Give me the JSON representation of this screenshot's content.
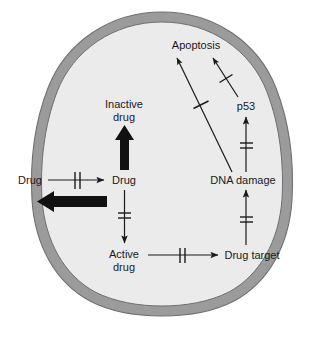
{
  "figure": {
    "background_color": "#ffffff"
  },
  "cell": {
    "name": "cell",
    "membrane_color": "#9b9b9b",
    "membrane_outline_color": "#6f6f6f",
    "cytoplasm_color": "#ebebeb",
    "shape": "ovoid"
  },
  "nodes": {
    "extracellular_drug": {
      "label": "Drug",
      "x": 30,
      "y": 182
    },
    "intracellular_drug": {
      "label": "Drug",
      "x": 124,
      "y": 182
    },
    "inactive_drug": {
      "label_line1": "Inactive",
      "label_line2": "drug",
      "x": 124,
      "y": 118
    },
    "active_drug": {
      "label_line1": "Active",
      "label_line2": "drug",
      "x": 124,
      "y": 255
    },
    "drug_target": {
      "label": "Drug target",
      "x": 252,
      "y": 256
    },
    "dna_damage": {
      "label": "DNA damage",
      "x": 243,
      "y": 181
    },
    "p53": {
      "label": "p53",
      "x": 246,
      "y": 107
    },
    "apoptosis": {
      "label": "Apoptosis",
      "x": 196,
      "y": 46
    }
  },
  "edges": [
    {
      "name": "drug-influx",
      "from": "extracellular_drug",
      "to": "intracellular_drug",
      "style": "thin-arrow",
      "marker": "double-bar"
    },
    {
      "name": "drug-efflux",
      "from": "intracellular_drug",
      "to": "extracellular_drug",
      "style": "thick-arrow",
      "marker": "none"
    },
    {
      "name": "drug-inactivation",
      "from": "intracellular_drug",
      "to": "inactive_drug",
      "style": "thick-arrow",
      "marker": "none"
    },
    {
      "name": "drug-activation",
      "from": "intracellular_drug",
      "to": "active_drug",
      "style": "thin-arrow",
      "marker": "double-bar"
    },
    {
      "name": "active-drug-to-target",
      "from": "active_drug",
      "to": "drug_target",
      "style": "thin-arrow",
      "marker": "double-bar"
    },
    {
      "name": "target-to-dna-damage",
      "from": "drug_target",
      "to": "dna_damage",
      "style": "thin-arrow",
      "marker": "double-bar"
    },
    {
      "name": "dna-damage-to-p53",
      "from": "dna_damage",
      "to": "p53",
      "style": "thin-arrow",
      "marker": "double-bar"
    },
    {
      "name": "p53-to-apoptosis",
      "from": "p53",
      "to": "apoptosis",
      "style": "thin-arrow",
      "marker": "single-bar"
    },
    {
      "name": "dna-damage-to-apoptosis",
      "from": "dna_damage",
      "to": "apoptosis",
      "style": "thin-arrow",
      "marker": "single-bar"
    }
  ],
  "colors": {
    "line": "#1a1a1a",
    "thick_arrow": "#111111",
    "membrane": "#9b9b9b",
    "cytoplasm": "#ebebeb"
  }
}
